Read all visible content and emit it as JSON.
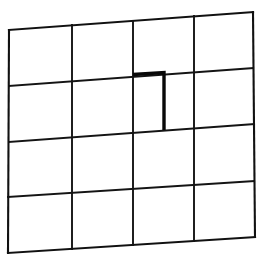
{
  "figure": {
    "background_color": "#ffffff",
    "canvas": {
      "width": 261,
      "height": 260
    },
    "line_color": "#141414",
    "emphasis_color": "#080808",
    "rows": 4,
    "columns": 4,
    "outline": {
      "name": "grid-outline",
      "top_left": [
        9,
        30
      ],
      "top_right": [
        253,
        12
      ],
      "bottom_right": [
        255,
        237
      ],
      "bottom_left": [
        8,
        253
      ]
    },
    "vertical_lines": [
      {
        "name": "vertical-line-0",
        "top": [
          9,
          30
        ],
        "bottom": [
          8,
          253
        ]
      },
      {
        "name": "vertical-line-1",
        "top": [
          72,
          25
        ],
        "bottom": [
          72,
          249
        ]
      },
      {
        "name": "vertical-line-2",
        "top": [
          133,
          21
        ],
        "bottom": [
          133,
          245
        ]
      },
      {
        "name": "vertical-line-3",
        "top": [
          194,
          16
        ],
        "bottom": [
          194,
          241
        ]
      },
      {
        "name": "vertical-line-4",
        "top": [
          253,
          12
        ],
        "bottom": [
          255,
          237
        ]
      }
    ],
    "horizontal_lines": [
      {
        "name": "horizontal-line-0",
        "left": [
          9,
          30
        ],
        "right": [
          253,
          12
        ]
      },
      {
        "name": "horizontal-line-1",
        "left": [
          9,
          86
        ],
        "right": [
          253,
          68
        ]
      },
      {
        "name": "horizontal-line-2",
        "left": [
          9,
          142
        ],
        "right": [
          254,
          124
        ]
      },
      {
        "name": "horizontal-line-3",
        "left": [
          8,
          197
        ],
        "right": [
          254,
          181
        ]
      },
      {
        "name": "horizontal-line-4",
        "left": [
          8,
          253
        ],
        "right": [
          255,
          237
        ]
      }
    ],
    "emphasis": {
      "name": "emphasized-partition",
      "shape": "corner-stroke",
      "cell_row": 2,
      "cell_column": 3,
      "cap_start": [
        133,
        74
      ],
      "cap_end": [
        164,
        72
      ],
      "stem_start": [
        164,
        72
      ],
      "stem_end": [
        164,
        130
      ]
    }
  }
}
